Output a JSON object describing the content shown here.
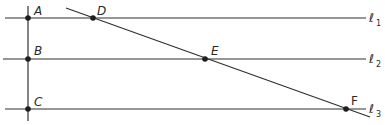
{
  "diagram": {
    "lines": {
      "l1": {
        "label": "ℓ",
        "subscript": "1"
      },
      "l2": {
        "label": "ℓ",
        "subscript": "2"
      },
      "l3": {
        "label": "ℓ",
        "subscript": "3"
      }
    },
    "points": {
      "A": {
        "label": "A"
      },
      "B": {
        "label": "B"
      },
      "C": {
        "label": "C"
      },
      "D": {
        "label": "D"
      },
      "E": {
        "label": "E"
      },
      "F": {
        "label": "F"
      }
    },
    "colors": {
      "line": "#2f2f2f",
      "point": "#1e1e1e",
      "background": "#ffffff"
    }
  }
}
